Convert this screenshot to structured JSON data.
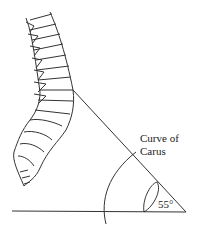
{
  "labels": {
    "curve_line1": "Curve of",
    "curve_line2": "Carus",
    "angle": "55°"
  },
  "figure": {
    "angle_degrees": 55
  }
}
